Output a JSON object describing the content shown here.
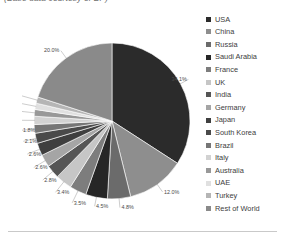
{
  "caption": "(Base data courtesy of BP)",
  "legend": {
    "entries": [
      {
        "label": "USA",
        "color": "#2b2b2b"
      },
      {
        "label": "China",
        "color": "#8e8e8e"
      },
      {
        "label": "Russia",
        "color": "#6b6b6b"
      },
      {
        "label": "Saudi Arabia",
        "color": "#262626"
      },
      {
        "label": "France",
        "color": "#7d7d7d"
      },
      {
        "label": "UK",
        "color": "#c6c6c6"
      },
      {
        "label": "India",
        "color": "#555555"
      },
      {
        "label": "Germany",
        "color": "#a5a5a5"
      },
      {
        "label": "Japan",
        "color": "#3f3f3f"
      },
      {
        "label": "South Korea",
        "color": "#4a4a4a"
      },
      {
        "label": "Brazil",
        "color": "#767676"
      },
      {
        "label": "Italy",
        "color": "#d2d2d2"
      },
      {
        "label": "Australia",
        "color": "#989898"
      },
      {
        "label": "UAE",
        "color": "#e0e0e0"
      },
      {
        "label": "Turkey",
        "color": "#b5b5b5"
      },
      {
        "label": "Rest of World",
        "color": "#8a8a8a"
      }
    ]
  },
  "chart_data": {
    "type": "pie",
    "title": "",
    "legend_position": "right",
    "start_angle_deg": 0,
    "direction": "clockwise",
    "value_suffix": "%",
    "categories": [
      "USA",
      "China",
      "Russia",
      "Saudi Arabia",
      "France",
      "UK",
      "India",
      "Germany",
      "Japan",
      "South Korea",
      "Brazil",
      "Italy",
      "Australia",
      "UAE",
      "Turkey",
      "Rest of World"
    ],
    "values": [
      34.1,
      12.0,
      4.8,
      4.5,
      3.5,
      3.4,
      2.8,
      2.6,
      2.6,
      2.1,
      1.8,
      1.7,
      1.4,
      1.3,
      1.3,
      20.0
    ],
    "data_labels": [
      "34.1%",
      "12.0%",
      "4.8%",
      "4.5%",
      "3.5%",
      "3.4%",
      "2.8%",
      "2.6%",
      "2.6%",
      "2.1%",
      "1.8%",
      "1.7%",
      "1.4%",
      "1.3%",
      "1.3%",
      "20.0%"
    ],
    "colors": [
      "#2b2b2b",
      "#8e8e8e",
      "#6b6b6b",
      "#262626",
      "#7d7d7d",
      "#c6c6c6",
      "#555555",
      "#a5a5a5",
      "#3f3f3f",
      "#4a4a4a",
      "#767676",
      "#d2d2d2",
      "#989898",
      "#e0e0e0",
      "#b5b5b5",
      "#8a8a8a"
    ]
  }
}
